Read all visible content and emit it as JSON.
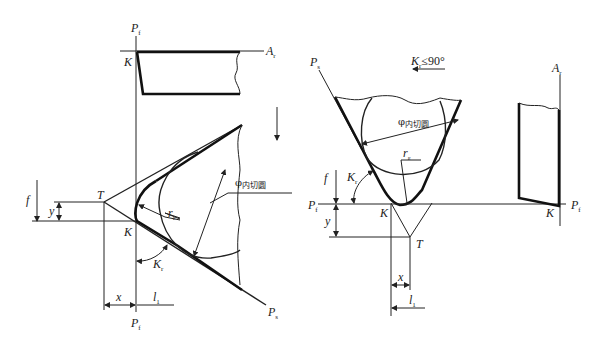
{
  "figure": {
    "left_panel": {
      "labels": {
        "pf_top": "P",
        "pf_top_sub": "f",
        "ar": "A",
        "ar_sub": "r",
        "k_top": "K",
        "t": "T",
        "k": "K",
        "f": "f",
        "y": "y",
        "r": "r",
        "r_sub": "ε",
        "kr": "K",
        "kr_sub": "r",
        "phi": "φ",
        "phi_sub": "内切圆",
        "x": "x",
        "l1": "l",
        "l1_sub": "1",
        "pf_bottom": "P",
        "pf_bottom_sub": "f",
        "ps": "P",
        "ps_sub": "s"
      },
      "feed_arrow": "down"
    },
    "right_panel": {
      "labels": {
        "ps": "P",
        "ps_sub": "s",
        "condition": "K",
        "condition_sub": "r",
        "condition_rest": "≤90°",
        "ar": "A",
        "ar_sub": "r",
        "phi": "φ",
        "phi_sub": "内切圆",
        "r": "r",
        "r_sub": "ε",
        "f": "f",
        "kr": "K",
        "kr_sub": "r",
        "pf_left": "P",
        "pf_left_sub": "f",
        "k": "K",
        "k2": "K",
        "pf_right": "P",
        "pf_right_sub": "f",
        "y": "y",
        "t": "T",
        "x": "x",
        "l1": "l",
        "l1_sub": "1"
      },
      "feed_arrow": "left"
    }
  }
}
